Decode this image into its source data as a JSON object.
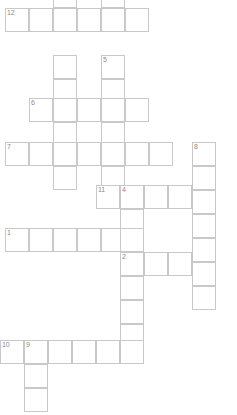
{
  "puzzle": {
    "title": "Crossword Grid",
    "cell_size": 24,
    "grid_width": 237,
    "grid_height": 415,
    "cell_border_color": "#c9c9c9",
    "cell_fill_color": "#ffffff",
    "number_color": "#8a8a8a",
    "background_color": "#ffffff",
    "entries": [
      {
        "number": "12",
        "direction": "across",
        "x": 5,
        "y": 8,
        "length": 6,
        "label": "12-across"
      },
      {
        "number": "",
        "direction": "down",
        "x": 53,
        "y": 0,
        "length": 1,
        "label": "unnumbered-down-top-left"
      },
      {
        "number": "",
        "direction": "down",
        "x": 53,
        "y": 55,
        "length": 2,
        "label": "unnumbered-down-segment"
      },
      {
        "number": "5",
        "direction": "down",
        "x": 101,
        "y": 55,
        "length": 2,
        "label": "5-down"
      },
      {
        "number": "6",
        "direction": "across",
        "x": 29,
        "y": 98,
        "length": 5,
        "label": "6-across"
      },
      {
        "number": "7",
        "direction": "across",
        "x": 5,
        "y": 142,
        "length": 7,
        "label": "7-across"
      },
      {
        "number": "8",
        "direction": "down",
        "x": 192,
        "y": 142,
        "length": 7,
        "label": "8-down"
      },
      {
        "number": "",
        "direction": "down",
        "x": 53,
        "y": 166,
        "length": 1,
        "label": "unnumbered-down-below-7"
      },
      {
        "number": "11",
        "direction": "across",
        "x": 96,
        "y": 185,
        "length": 1,
        "label": "11-across-start"
      },
      {
        "number": "4",
        "direction": "across",
        "x": 120,
        "y": 185,
        "length": 4,
        "label": "4-across"
      },
      {
        "number": "1",
        "direction": "across",
        "x": 5,
        "y": 228,
        "length": 6,
        "label": "1-across"
      },
      {
        "number": "2",
        "direction": "across",
        "x": 120,
        "y": 252,
        "length": 4,
        "label": "2-across"
      },
      {
        "number": "",
        "direction": "down",
        "x": 120,
        "y": 276,
        "length": 3,
        "label": "unnumbered-down-middle"
      },
      {
        "number": "10",
        "direction": "across",
        "x": 0,
        "y": 340,
        "length": 1,
        "label": "10-across-start"
      },
      {
        "number": "9",
        "direction": "across",
        "x": 24,
        "y": 340,
        "length": 5,
        "label": "9-across"
      },
      {
        "number": "",
        "direction": "down",
        "x": 24,
        "y": 364,
        "length": 3,
        "label": "9-down-continuation"
      }
    ],
    "cells": [
      {
        "x": 5,
        "y": 8,
        "num": "12"
      },
      {
        "x": 29,
        "y": 8,
        "num": ""
      },
      {
        "x": 53,
        "y": 8,
        "num": ""
      },
      {
        "x": 77,
        "y": 8,
        "num": ""
      },
      {
        "x": 101,
        "y": 8,
        "num": ""
      },
      {
        "x": 125,
        "y": 8,
        "num": ""
      },
      {
        "x": 53,
        "y": -16,
        "num": ""
      },
      {
        "x": 101,
        "y": -16,
        "num": ""
      },
      {
        "x": 53,
        "y": 55,
        "num": ""
      },
      {
        "x": 53,
        "y": 79,
        "num": ""
      },
      {
        "x": 101,
        "y": 55,
        "num": "5"
      },
      {
        "x": 101,
        "y": 79,
        "num": ""
      },
      {
        "x": 29,
        "y": 98,
        "num": "6"
      },
      {
        "x": 53,
        "y": 98,
        "num": ""
      },
      {
        "x": 77,
        "y": 98,
        "num": ""
      },
      {
        "x": 101,
        "y": 98,
        "num": ""
      },
      {
        "x": 125,
        "y": 98,
        "num": ""
      },
      {
        "x": 53,
        "y": 122,
        "num": ""
      },
      {
        "x": 101,
        "y": 122,
        "num": ""
      },
      {
        "x": 5,
        "y": 142,
        "num": "7"
      },
      {
        "x": 29,
        "y": 142,
        "num": ""
      },
      {
        "x": 53,
        "y": 142,
        "num": ""
      },
      {
        "x": 77,
        "y": 142,
        "num": ""
      },
      {
        "x": 101,
        "y": 142,
        "num": ""
      },
      {
        "x": 125,
        "y": 142,
        "num": ""
      },
      {
        "x": 149,
        "y": 142,
        "num": ""
      },
      {
        "x": 192,
        "y": 142,
        "num": "8"
      },
      {
        "x": 192,
        "y": 166,
        "num": ""
      },
      {
        "x": 192,
        "y": 190,
        "num": ""
      },
      {
        "x": 192,
        "y": 214,
        "num": ""
      },
      {
        "x": 192,
        "y": 238,
        "num": ""
      },
      {
        "x": 192,
        "y": 262,
        "num": ""
      },
      {
        "x": 192,
        "y": 286,
        "num": ""
      },
      {
        "x": 53,
        "y": 166,
        "num": ""
      },
      {
        "x": 101,
        "y": 166,
        "num": ""
      },
      {
        "x": 96,
        "y": 185,
        "num": "11"
      },
      {
        "x": 120,
        "y": 185,
        "num": "4"
      },
      {
        "x": 144,
        "y": 185,
        "num": ""
      },
      {
        "x": 168,
        "y": 185,
        "num": ""
      },
      {
        "x": 120,
        "y": 209,
        "num": ""
      },
      {
        "x": 5,
        "y": 228,
        "num": "1"
      },
      {
        "x": 29,
        "y": 228,
        "num": ""
      },
      {
        "x": 53,
        "y": 228,
        "num": ""
      },
      {
        "x": 77,
        "y": 228,
        "num": ""
      },
      {
        "x": 101,
        "y": 228,
        "num": ""
      },
      {
        "x": 120,
        "y": 228,
        "num": ""
      },
      {
        "x": 120,
        "y": 252,
        "num": "2"
      },
      {
        "x": 144,
        "y": 252,
        "num": ""
      },
      {
        "x": 168,
        "y": 252,
        "num": ""
      },
      {
        "x": 120,
        "y": 276,
        "num": ""
      },
      {
        "x": 120,
        "y": 300,
        "num": ""
      },
      {
        "x": 120,
        "y": 324,
        "num": ""
      },
      {
        "x": 0,
        "y": 340,
        "num": "10"
      },
      {
        "x": 24,
        "y": 340,
        "num": "9"
      },
      {
        "x": 48,
        "y": 340,
        "num": ""
      },
      {
        "x": 72,
        "y": 340,
        "num": ""
      },
      {
        "x": 96,
        "y": 340,
        "num": ""
      },
      {
        "x": 120,
        "y": 340,
        "num": ""
      },
      {
        "x": 24,
        "y": 364,
        "num": ""
      },
      {
        "x": 24,
        "y": 388,
        "num": ""
      }
    ]
  }
}
